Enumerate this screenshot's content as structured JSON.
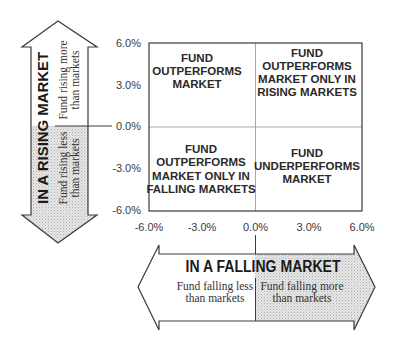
{
  "diagram": {
    "type": "quadrant",
    "y_axis": {
      "ticks": [
        "6.0%",
        "3.0%",
        "0.0%",
        "-3.0%",
        "-6.0%"
      ],
      "range": [
        -6.0,
        6.0
      ]
    },
    "x_axis": {
      "ticks": [
        "-6.0%",
        "-3.0%",
        "0.0%",
        "3.0%",
        "6.0%"
      ],
      "range": [
        -6.0,
        6.0
      ]
    },
    "quadrants": {
      "top_left": [
        "FUND",
        "OUTPERFORMS",
        "MARKET"
      ],
      "top_right": [
        "FUND",
        "OUTPERFORMS",
        "MARKET ONLY IN",
        "RISING MARKETS"
      ],
      "bottom_left": [
        "FUND",
        "OUTPERFORMS",
        "MARKET ONLY IN",
        "FALLING MARKETS"
      ],
      "bottom_right": [
        "FUND",
        "UNDERPERFORMS",
        "MARKET"
      ]
    },
    "rising_arrow": {
      "title": "IN A RISING MARKET",
      "upper": [
        "Fund rising more",
        "than markets"
      ],
      "lower": [
        "Fund rising less",
        "than markets"
      ]
    },
    "falling_arrow": {
      "title": "IN A FALLING MARKET",
      "left": [
        "Fund falling less",
        "than markets"
      ],
      "right": [
        "Fund falling more",
        "than markets"
      ]
    },
    "colors": {
      "outline": "#3a3a3a",
      "grid": "#a8a8a8",
      "stipple_base": "#e4e4e4",
      "stipple_dot": "#b4b4b4"
    }
  }
}
